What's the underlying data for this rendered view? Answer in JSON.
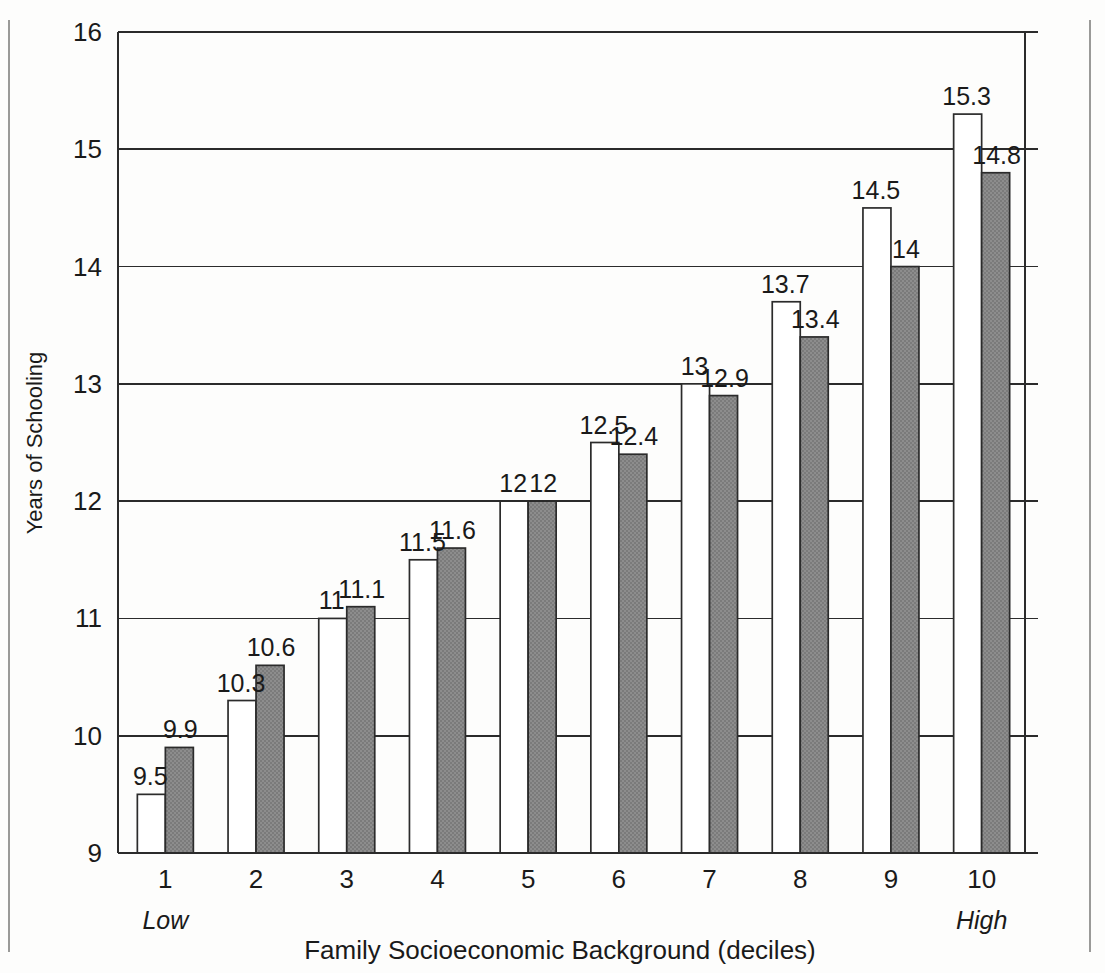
{
  "chart_data": {
    "type": "bar",
    "title": "",
    "xlabel": "Family Socioeconomic Background (deciles)",
    "ylabel": "Years of Schooling",
    "categories": [
      "1",
      "2",
      "3",
      "4",
      "5",
      "6",
      "7",
      "8",
      "9",
      "10"
    ],
    "x_anchor_low": "Low",
    "x_anchor_high": "High",
    "ylim": [
      9,
      16
    ],
    "yticks": [
      9,
      10,
      11,
      12,
      13,
      14,
      15,
      16
    ],
    "ytick_labels": [
      "9",
      "10",
      "11",
      "12",
      "13",
      "14",
      "15",
      "16"
    ],
    "grid": "horizontal",
    "legend": "none",
    "series": [
      {
        "name": "open-bar",
        "style": "white-fill",
        "fill_color": "#ffffff",
        "values": [
          9.5,
          10.3,
          11,
          11.5,
          12,
          12.5,
          13,
          13.7,
          14.5,
          15.3
        ],
        "labels": [
          "9.5",
          "10.3",
          "11",
          "11.5",
          "12",
          "12.5",
          "13",
          "13.7",
          "14.5",
          "15.3"
        ]
      },
      {
        "name": "shaded-bar",
        "style": "gray-fill",
        "fill_color": "#8a8a8a",
        "values": [
          9.9,
          10.6,
          11.1,
          11.6,
          12,
          12.4,
          12.9,
          13.4,
          14,
          14.8
        ],
        "labels": [
          "9.9",
          "10.6",
          "11.1",
          "11.6",
          "12",
          "12.4",
          "12.9",
          "13.4",
          "14",
          "14.8"
        ]
      }
    ]
  },
  "colors": {
    "ink": "#2b2b2b",
    "shaded_bar": "#8a8a8a",
    "open_bar": "#ffffff",
    "page": "#fdfdfc",
    "margin_rule": "#9a9a98"
  }
}
